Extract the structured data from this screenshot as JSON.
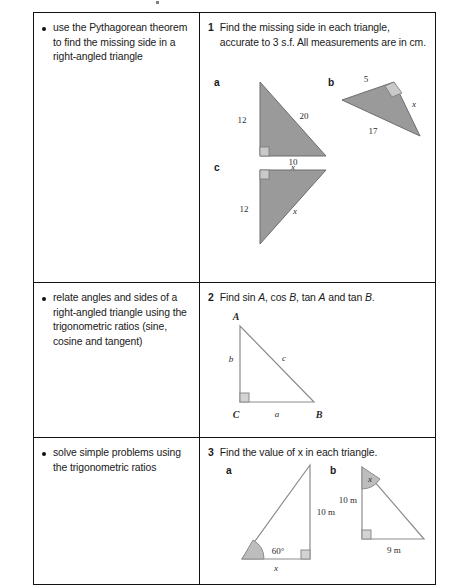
{
  "document": {
    "type": "syllabus-checklist-table",
    "columns": [
      "objectives",
      "questions"
    ]
  },
  "rows": [
    {
      "objective": "use the Pythagorean theorem to find the missing side in a right-angled triangle",
      "question_number": "1",
      "question_text": "Find the missing side in each triangle, accurate to 3 s.f. All measurements are in cm.",
      "parts": [
        {
          "label": "a",
          "figure": "right-triangle-vertical-left",
          "right_angle_at": "bottom-left",
          "labels": {
            "left_side": "12",
            "hypotenuse": "20",
            "base": "x"
          }
        },
        {
          "label": "b",
          "figure": "rotated-right-triangle",
          "right_angle_at": "top-right",
          "labels": {
            "upper_side": "5",
            "long_side": "17",
            "other_side": "x"
          }
        },
        {
          "label": "c",
          "figure": "right-triangle-top-left-angle",
          "right_angle_at": "top-left",
          "labels": {
            "top_side": "10",
            "left_side": "12",
            "hypotenuse": "x"
          }
        }
      ]
    },
    {
      "objective": "relate angles and sides of a right-angled triangle using the trigonometric ratios (sine, cosine and tangent)",
      "question_number": "2",
      "question_text_parts": [
        "Find sin ",
        "A",
        ", cos ",
        "B",
        ", tan ",
        "A",
        " and tan ",
        "B",
        "."
      ],
      "question_text": "Find sin A, cos B, tan A and tan B.",
      "parts": [
        {
          "label": "",
          "figure": "labelled-right-triangle-ABC",
          "right_angle_at": "C",
          "vertices": {
            "top": "A",
            "bottom_left": "C",
            "bottom_right": "B"
          },
          "labels": {
            "left_side": "b",
            "hypotenuse": "c",
            "base": "a"
          }
        }
      ]
    },
    {
      "objective": "solve simple problems using the trigonometric ratios",
      "question_number": "3",
      "question_text": "Find the value of x in each triangle.",
      "parts": [
        {
          "label": "a",
          "figure": "right-triangle-angle-bottom-left",
          "right_angle_at": "bottom-right",
          "labels": {
            "angle": "60°",
            "right_side": "10 m",
            "base": "x"
          }
        },
        {
          "label": "b",
          "figure": "right-triangle-angle-top",
          "right_angle_at": "bottom-left",
          "labels": {
            "angle": "x",
            "left_side": "10 m",
            "base": "9 m"
          }
        }
      ]
    }
  ],
  "colors": {
    "triangle_fill": "#9a9a9a",
    "triangle_stroke": "#6d6d6d",
    "right_angle_box": "#c9c9c9",
    "border": "#111111",
    "text": "#1a1a1a",
    "page_background": "#ffffff"
  }
}
